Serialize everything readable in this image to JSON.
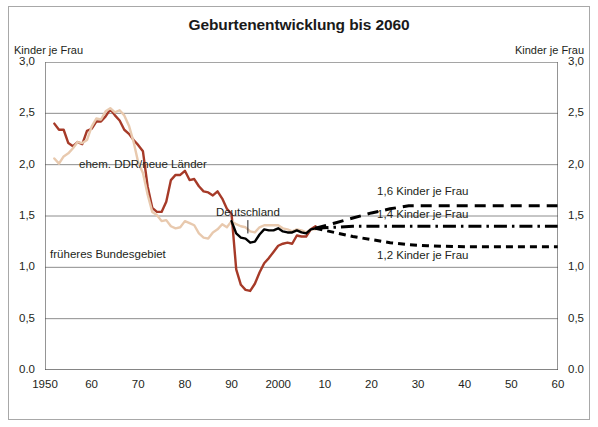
{
  "chart_data": {
    "type": "line",
    "title": "Geburtenentwicklung bis 2060",
    "xlabel": "",
    "ylabel": "Kinder je Frau",
    "ylabel_left": "Kinder je Frau",
    "ylabel_right": "Kinder je Frau",
    "xlim": [
      1950,
      2060
    ],
    "ylim": [
      0.0,
      3.0
    ],
    "grid": true,
    "legend_position": "inline-annotations",
    "y_ticks": [
      "0.0",
      "0,5",
      "1,0",
      "1,5",
      "2,0",
      "2,5",
      "3,0"
    ],
    "y_tick_values": [
      0.0,
      0.5,
      1.0,
      1.5,
      2.0,
      2.5,
      3.0
    ],
    "x_ticks": [
      "1950",
      "60",
      "70",
      "80",
      "90",
      "2000",
      "10",
      "20",
      "30",
      "40",
      "50",
      "60"
    ],
    "x_tick_values": [
      1950,
      1960,
      1970,
      1980,
      1990,
      2000,
      2010,
      2020,
      2030,
      2040,
      2050,
      2060
    ],
    "colors": {
      "ddr": "#A63A28",
      "bundesgebiet": "#E8C9AE",
      "deutschland": "#000000",
      "projection": "#000000",
      "grid": "#808080",
      "axis": "#4d4d4d",
      "frame": "#a8a8a8"
    },
    "annotations": [
      {
        "name": "ehem-ddr-neue-laender",
        "text": "ehem. DDR/neue Länder",
        "x": 1971.0,
        "y": 1.99
      },
      {
        "name": "deutschland",
        "text": "Deutschland",
        "x": 1993.5,
        "y": 1.52
      },
      {
        "name": "frueheres-bundesgebiet",
        "text": "früheres Bundesgebiet",
        "x": 1963.5,
        "y": 1.11
      },
      {
        "name": "variante-1-6",
        "text": "1,6 Kinder je Frau",
        "x": 2031.0,
        "y": 1.72
      },
      {
        "name": "variante-1-4",
        "text": "1,4 Kinder je Frau",
        "x": 2031.0,
        "y": 1.5
      },
      {
        "name": "variante-1-2",
        "text": "1,2 Kinder je Frau",
        "x": 2031.0,
        "y": 1.1
      }
    ],
    "series": [
      {
        "name": "ehem. DDR/neue Länder",
        "id": "ddr",
        "color": "#A63A28",
        "style": "solid",
        "x": [
          1952,
          1953,
          1954,
          1955,
          1956,
          1957,
          1958,
          1959,
          1960,
          1961,
          1962,
          1963,
          1964,
          1965,
          1966,
          1967,
          1968,
          1969,
          1970,
          1971,
          1972,
          1973,
          1974,
          1975,
          1976,
          1977,
          1978,
          1979,
          1980,
          1981,
          1982,
          1983,
          1984,
          1985,
          1986,
          1987,
          1988,
          1989,
          1990,
          1991,
          1992,
          1993,
          1994,
          1995,
          1996,
          1997,
          1998,
          1999,
          2000,
          2001,
          2002,
          2003,
          2004,
          2005,
          2006,
          2007,
          2008
        ],
        "y": [
          2.4,
          2.34,
          2.34,
          2.21,
          2.18,
          2.22,
          2.2,
          2.33,
          2.35,
          2.42,
          2.42,
          2.47,
          2.54,
          2.48,
          2.43,
          2.34,
          2.3,
          2.24,
          2.19,
          2.13,
          1.79,
          1.58,
          1.54,
          1.54,
          1.64,
          1.85,
          1.9,
          1.9,
          1.94,
          1.85,
          1.86,
          1.79,
          1.74,
          1.73,
          1.7,
          1.74,
          1.67,
          1.57,
          1.52,
          0.98,
          0.83,
          0.78,
          0.77,
          0.84,
          0.95,
          1.04,
          1.09,
          1.15,
          1.21,
          1.23,
          1.24,
          1.23,
          1.31,
          1.3,
          1.3,
          1.37,
          1.4
        ]
      },
      {
        "name": "früheres Bundesgebiet",
        "id": "bundesgebiet",
        "color": "#E8C9AE",
        "style": "solid",
        "x": [
          1952,
          1953,
          1954,
          1955,
          1956,
          1957,
          1958,
          1959,
          1960,
          1961,
          1962,
          1963,
          1964,
          1965,
          1966,
          1967,
          1968,
          1969,
          1970,
          1971,
          1972,
          1973,
          1974,
          1975,
          1976,
          1977,
          1978,
          1979,
          1980,
          1981,
          1982,
          1983,
          1984,
          1985,
          1986,
          1987,
          1988,
          1989,
          1990,
          1991,
          1992,
          1993,
          1994,
          1995,
          1996,
          1997,
          1998,
          1999,
          2000,
          2001,
          2002,
          2003,
          2004,
          2005,
          2006,
          2007,
          2008
        ],
        "y": [
          2.06,
          2.01,
          2.08,
          2.11,
          2.16,
          2.22,
          2.21,
          2.24,
          2.37,
          2.45,
          2.44,
          2.52,
          2.55,
          2.51,
          2.53,
          2.48,
          2.38,
          2.22,
          2.02,
          1.92,
          1.71,
          1.54,
          1.51,
          1.45,
          1.46,
          1.4,
          1.38,
          1.39,
          1.45,
          1.43,
          1.41,
          1.33,
          1.29,
          1.28,
          1.34,
          1.37,
          1.42,
          1.39,
          1.45,
          1.42,
          1.4,
          1.39,
          1.35,
          1.34,
          1.39,
          1.41,
          1.41,
          1.41,
          1.41,
          1.38,
          1.37,
          1.35,
          1.37,
          1.36,
          1.34,
          1.37,
          1.37
        ]
      },
      {
        "name": "Deutschland",
        "id": "deutschland",
        "color": "#000000",
        "style": "solid",
        "x": [
          1990,
          1991,
          1992,
          1993,
          1994,
          1995,
          1996,
          1997,
          1998,
          1999,
          2000,
          2001,
          2002,
          2003,
          2004,
          2005,
          2006,
          2007,
          2008
        ],
        "y": [
          1.45,
          1.33,
          1.29,
          1.28,
          1.24,
          1.25,
          1.32,
          1.37,
          1.36,
          1.36,
          1.38,
          1.35,
          1.34,
          1.34,
          1.36,
          1.34,
          1.33,
          1.37,
          1.38
        ]
      },
      {
        "name": "1,6 Kinder je Frau",
        "id": "projection-1-6",
        "color": "#000000",
        "style": "dashed",
        "x": [
          2008,
          2012,
          2016,
          2020,
          2024,
          2028,
          2032,
          2040,
          2050,
          2060
        ],
        "y": [
          1.38,
          1.43,
          1.48,
          1.53,
          1.57,
          1.6,
          1.6,
          1.6,
          1.6,
          1.6
        ]
      },
      {
        "name": "1,4 Kinder je Frau",
        "id": "projection-1-4",
        "color": "#000000",
        "style": "dashdot",
        "x": [
          2008,
          2012,
          2016,
          2020,
          2024,
          2028,
          2032,
          2040,
          2050,
          2060
        ],
        "y": [
          1.38,
          1.39,
          1.4,
          1.4,
          1.4,
          1.4,
          1.4,
          1.4,
          1.4,
          1.4
        ]
      },
      {
        "name": "1,2 Kinder je Frau",
        "id": "projection-1-2",
        "color": "#000000",
        "style": "dotted-dash",
        "x": [
          2008,
          2012,
          2016,
          2020,
          2024,
          2028,
          2032,
          2040,
          2050,
          2060
        ],
        "y": [
          1.38,
          1.34,
          1.3,
          1.27,
          1.24,
          1.22,
          1.21,
          1.2,
          1.2,
          1.2
        ]
      }
    ]
  }
}
